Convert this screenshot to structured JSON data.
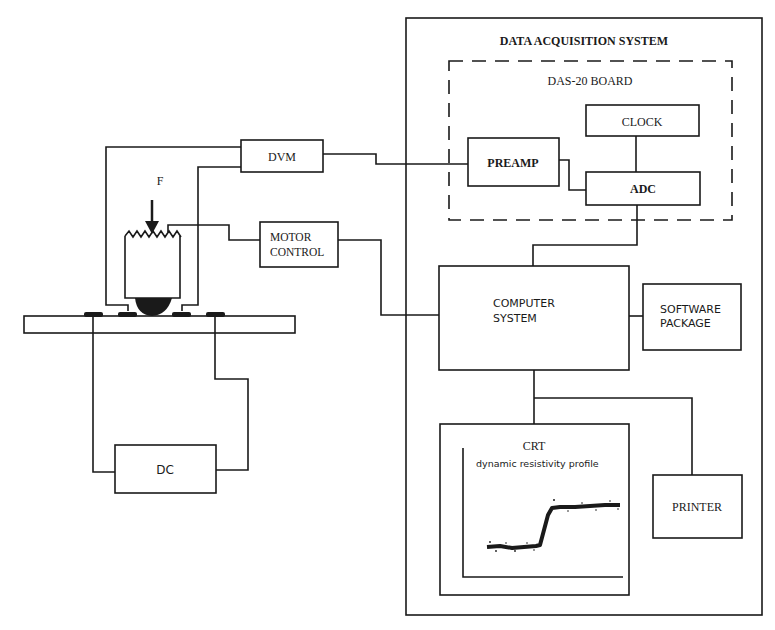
{
  "diagram": {
    "title": "DATA ACQUISITION SYSTEM",
    "board_label": "DAS-20 BOARD",
    "force_label": "F",
    "blocks": {
      "dvm": "DVM",
      "motor_control_line1": "MOTOR",
      "motor_control_line2": "CONTROL",
      "dc": "DC",
      "preamp": "PREAMP",
      "clock": "CLOCK",
      "adc": "ADC",
      "computer_line1": "COMPUTER",
      "computer_line2": "SYSTEM",
      "software_line1": "SOFTWARE",
      "software_line2": "PACKAGE",
      "crt": "CRT",
      "crt_caption": "dynamic resistivity profile",
      "printer": "PRINTER"
    },
    "colors": {
      "ink": "#1a1a1a",
      "paper": "#ffffff"
    },
    "connections": [
      "probe -> DVM",
      "DVM -> PREAMP",
      "PREAMP -> ADC",
      "CLOCK -> ADC",
      "ADC -> COMPUTER SYSTEM",
      "probe -> MOTOR CONTROL",
      "MOTOR CONTROL -> COMPUTER SYSTEM",
      "COMPUTER SYSTEM -> SOFTWARE PACKAGE",
      "COMPUTER SYSTEM -> CRT",
      "COMPUTER SYSTEM -> PRINTER",
      "substrate contacts -> DC"
    ]
  }
}
